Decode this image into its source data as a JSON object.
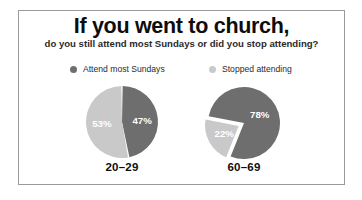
{
  "figure": {
    "title": "If you went to church,",
    "subtitle": "do you still attend most Sundays or did you stop attending?"
  },
  "colors": {
    "attend": "#6e6e6e",
    "stopped": "#c9c9c9",
    "label_text": "#ffffff",
    "frame_border": "#9a9a9a",
    "background": "#ffffff"
  },
  "legend": {
    "items": [
      {
        "label": "Attend most Sundays",
        "color": "#6e6e6e"
      },
      {
        "label": "Stopped attending",
        "color": "#c9c9c9"
      }
    ]
  },
  "pies": [
    {
      "caption": "20–29",
      "slices": [
        {
          "name": "Attend most Sundays",
          "label": "47%",
          "value": 47,
          "color": "#6e6e6e"
        },
        {
          "name": "Stopped attending",
          "label": "53%",
          "value": 53,
          "color": "#c9c9c9"
        }
      ]
    },
    {
      "caption": "60–69",
      "slices": [
        {
          "name": "Attend most Sundays",
          "label": "78%",
          "value": 78,
          "color": "#6e6e6e"
        },
        {
          "name": "Stopped attending",
          "label": "22%",
          "value": 22,
          "color": "#c9c9c9"
        }
      ]
    }
  ],
  "chart_data": {
    "type": "pie",
    "title": "If you went to church,",
    "subtitle": "do you still attend most Sundays or did you stop attending?",
    "legend_position": "top",
    "legend": [
      "Attend most Sundays",
      "Stopped attending"
    ],
    "categories": [
      "20–29",
      "60–69"
    ],
    "series": [
      {
        "name": "Attend most Sundays",
        "values": [
          47,
          78
        ],
        "color": "#6e6e6e"
      },
      {
        "name": "Stopped attending",
        "values": [
          53,
          22
        ],
        "color": "#c9c9c9"
      }
    ],
    "units": "percent",
    "charts": [
      {
        "category": "20–29",
        "slices": [
          {
            "name": "Attend most Sundays",
            "value": 47,
            "label": "47%"
          },
          {
            "name": "Stopped attending",
            "value": 53,
            "label": "53%"
          }
        ]
      },
      {
        "category": "60–69",
        "slices": [
          {
            "name": "Attend most Sundays",
            "value": 78,
            "label": "78%"
          },
          {
            "name": "Stopped attending",
            "value": 22,
            "label": "22%"
          }
        ]
      }
    ]
  }
}
